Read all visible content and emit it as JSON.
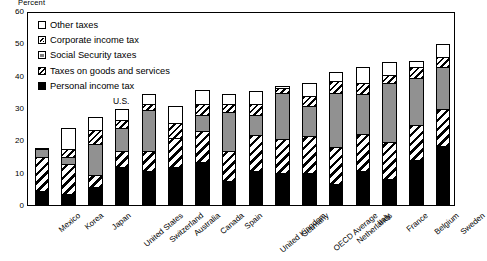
{
  "chart_data": {
    "type": "bar",
    "subtype": "stacked-bar",
    "title": "",
    "ylabel": "Percent",
    "xlabel": "",
    "ylim": [
      0,
      60
    ],
    "yticks": [
      0,
      10,
      20,
      30,
      40,
      50,
      60
    ],
    "grid": false,
    "legend_position": "top-left",
    "categories": [
      "Mexico",
      "Korea",
      "Japan",
      "United States",
      "Switzerland",
      "Australia",
      "Canada",
      "Spain",
      "United Kingdom",
      "Germany",
      "OECD Average",
      "Netherlands",
      "Italy",
      "France",
      "Belgium",
      "Sweden"
    ],
    "series": [
      {
        "name": "Personal income tax",
        "fill": "black",
        "values": [
          4.5,
          3.5,
          5.5,
          12.0,
          10.5,
          12.0,
          13.5,
          7.5,
          10.5,
          10.0,
          10.0,
          6.5,
          10.5,
          8.0,
          14.0,
          18.5
        ]
      },
      {
        "name": "Taxes on goods and services",
        "fill": "diagonal-hatch-wide",
        "values": [
          10.5,
          9.5,
          4.0,
          5.0,
          6.5,
          9.0,
          9.5,
          9.5,
          11.5,
          10.5,
          11.5,
          11.5,
          11.5,
          11.5,
          11.0,
          11.5
        ]
      },
      {
        "name": "Social Security taxes",
        "fill": "gray",
        "values": [
          2.5,
          2.0,
          9.5,
          7.0,
          12.5,
          0.0,
          5.0,
          12.0,
          6.0,
          14.5,
          9.5,
          17.0,
          12.5,
          18.5,
          14.5,
          13.0
        ]
      },
      {
        "name": "Corporate income tax",
        "fill": "diagonal-hatch-narrow",
        "values": [
          0.0,
          2.5,
          4.5,
          2.5,
          2.0,
          4.5,
          3.5,
          2.5,
          3.5,
          1.5,
          3.0,
          3.5,
          3.5,
          2.5,
          3.5,
          3.0
        ]
      },
      {
        "name": "Other taxes",
        "fill": "white",
        "values": [
          0.5,
          6.5,
          4.0,
          3.5,
          3.0,
          5.5,
          4.5,
          3.0,
          4.0,
          0.5,
          4.0,
          3.0,
          5.0,
          4.0,
          2.0,
          4.0
        ]
      }
    ],
    "totals": [
      18.0,
      24.0,
      27.5,
      30.0,
      34.5,
      31.0,
      36.0,
      34.5,
      35.5,
      37.0,
      38.0,
      41.5,
      43.0,
      44.5,
      45.0,
      50.0
    ],
    "annotations": [
      {
        "text": "U.S.",
        "category": "United States"
      }
    ]
  },
  "legend": {
    "items": [
      {
        "label": "Other taxes",
        "fill": "white"
      },
      {
        "label": "Corporate income tax",
        "fill": "diagonal-hatch-narrow"
      },
      {
        "label": "Social Security taxes",
        "fill": "gray"
      },
      {
        "label": "Taxes on goods and services",
        "fill": "diagonal-hatch-wide"
      },
      {
        "label": "Personal income tax",
        "fill": "black"
      }
    ]
  }
}
